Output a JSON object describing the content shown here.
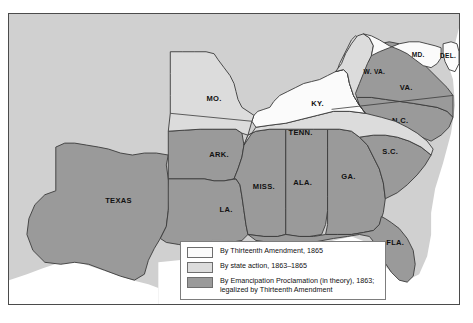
{
  "map": {
    "title": "Emancipation in the United States",
    "background_color": "#d0d0d0",
    "frame_border_color": "#4b4b4b",
    "colors": {
      "thirteenth_amendment": "#fbfbfb",
      "state_action": "#dcdcdc",
      "emancipation_proclamation": "#9a9a9a",
      "water": "#ffffff",
      "delta": "#c6c6c6",
      "border_line": "#3a3a3a",
      "label_text": "#111111"
    },
    "states": [
      {
        "id": "texas",
        "label": "TEXAS",
        "category": "emancipation_proclamation",
        "label_x": 110,
        "label_y": 190
      },
      {
        "id": "arkansas",
        "label": "ARK.",
        "category": "emancipation_proclamation",
        "label_x": 211,
        "label_y": 144
      },
      {
        "id": "louisiana",
        "label": "LA.",
        "category": "emancipation_proclamation",
        "label_x": 218,
        "label_y": 199
      },
      {
        "id": "mississippi",
        "label": "MISS.",
        "category": "emancipation_proclamation",
        "label_x": 256,
        "label_y": 176
      },
      {
        "id": "alabama",
        "label": "ALA.",
        "category": "emancipation_proclamation",
        "label_x": 295,
        "label_y": 172
      },
      {
        "id": "georgia",
        "label": "GA.",
        "category": "emancipation_proclamation",
        "label_x": 341,
        "label_y": 166
      },
      {
        "id": "florida",
        "label": "FLA.",
        "category": "emancipation_proclamation",
        "label_x": 388,
        "label_y": 233
      },
      {
        "id": "south-carolina",
        "label": "S.C.",
        "category": "emancipation_proclamation",
        "label_x": 383,
        "label_y": 141
      },
      {
        "id": "north-carolina",
        "label": "N.C.",
        "category": "emancipation_proclamation",
        "label_x": 393,
        "label_y": 110
      },
      {
        "id": "virginia",
        "label": "VA.",
        "category": "emancipation_proclamation",
        "label_x": 399,
        "label_y": 77
      },
      {
        "id": "tennessee",
        "label": "TENN.",
        "category": "state_action",
        "label_x": 293,
        "label_y": 122
      },
      {
        "id": "kentucky",
        "label": "KY.",
        "category": "thirteenth_amendment",
        "label_x": 310,
        "label_y": 93
      },
      {
        "id": "missouri",
        "label": "MO.",
        "category": "state_action",
        "label_x": 206,
        "label_y": 88
      },
      {
        "id": "west-virginia",
        "label": "W. VA.",
        "category": "state_action",
        "label_x": 367,
        "label_y": 60
      },
      {
        "id": "maryland",
        "label": "MD.",
        "category": "thirteenth_amendment",
        "label_x": 411,
        "label_y": 43
      },
      {
        "id": "delaware",
        "label": "DEL.",
        "category": "thirteenth_amendment",
        "label_x": 441,
        "label_y": 44
      }
    ]
  },
  "legend": {
    "items": [
      {
        "id": "legend-thirteenth-amendment",
        "swatch": "#fbfbfb",
        "text": "By Thirteenth Amendment, 1865"
      },
      {
        "id": "legend-state-action",
        "swatch": "#dcdcdc",
        "text": "By state action, 1863–1865"
      },
      {
        "id": "legend-emancipation",
        "swatch": "#9a9a9a",
        "text": "By Emancipation Proclamation (in theory), 1863;\nlegalized by Thirteenth Amendment"
      }
    ]
  }
}
